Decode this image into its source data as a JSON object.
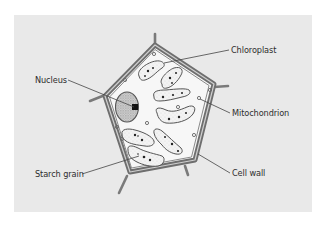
{
  "diagram": {
    "type": "labelled biological illustration",
    "colors": {
      "panel_background": "#e9e9e9",
      "cell_interior": "#f7f7f7",
      "cell_wall": "#707070",
      "label_text": "#2e2e2e",
      "leader_line": "#444444"
    },
    "labels": {
      "chloroplast": "Chloroplast",
      "nucleus": "Nucleus",
      "mitochondrion": "Mitochondrion",
      "starch_grain": "Starch grain",
      "cell_wall": "Cell wall"
    }
  }
}
